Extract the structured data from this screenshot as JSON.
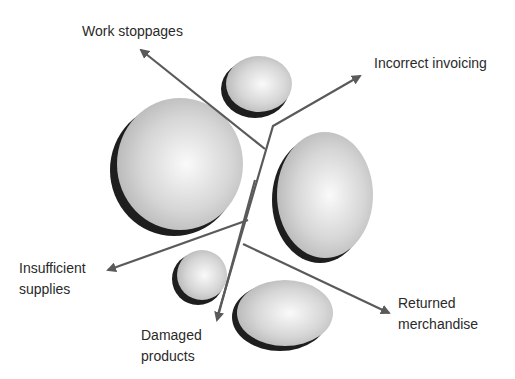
{
  "diagram": {
    "type": "problem-arrow-diagram",
    "labels": {
      "work_stoppages": "Work stoppages",
      "incorrect_invoicing": "Incorrect invoicing",
      "insufficient_supplies": "Insufficient\nsupplies",
      "damaged_products": "Damaged\nproducts",
      "returned_merchandise": "Returned\nmerchandise"
    },
    "colors": {
      "arrow": "#5a5a5a",
      "sphere_light": "#f8f8f8",
      "sphere_dark": "#b8b8b8",
      "shadow": "#1e1e1e",
      "text": "#2a2a2a"
    }
  }
}
